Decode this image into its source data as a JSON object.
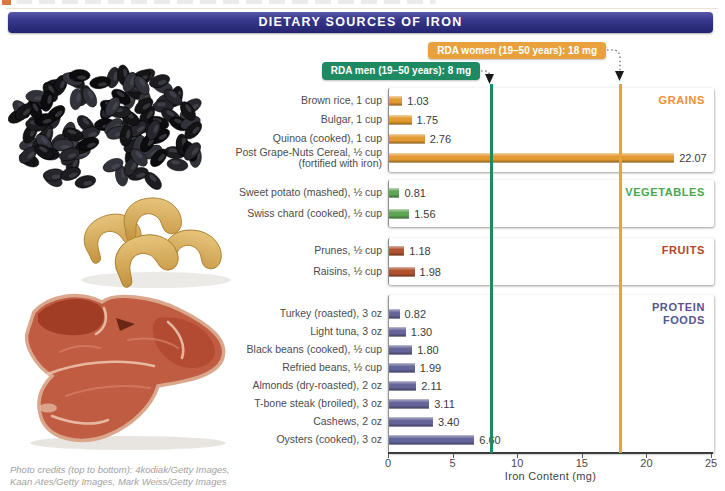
{
  "header": {
    "title": "DIETARY SOURCES OF IRON",
    "bar_color": "#32327e"
  },
  "rda": {
    "men": {
      "label": "RDA men (19–50 years): 8 mg",
      "value": 8,
      "color": "#1e8a62"
    },
    "women": {
      "label": "RDA women (19–50 years): 18 mg",
      "value": 18,
      "color": "#e8a13c"
    }
  },
  "chart_data": {
    "type": "bar",
    "orientation": "horizontal",
    "title": "Dietary Sources of Iron",
    "xlabel": "Iron Content (mg)",
    "xlim": [
      0,
      25
    ],
    "xticks": [
      0,
      5,
      10,
      15,
      20,
      25
    ],
    "grid": false,
    "reference_lines": [
      {
        "name": "RDA men (19–50 years)",
        "value": 8,
        "color": "#1e8a62"
      },
      {
        "name": "RDA women (19–50 years)",
        "value": 18,
        "color": "#e8a13c"
      }
    ],
    "groups": [
      {
        "name": "GRAINS",
        "bar_color": "#e39a31",
        "label_color": "#ef8f2d",
        "items": [
          {
            "label": "Brown rice, 1 cup",
            "value": 1.03,
            "display": "1.03"
          },
          {
            "label": "Bulgar, 1 cup",
            "value": 1.75,
            "display": "1.75"
          },
          {
            "label": "Quinoa (cooked), 1 cup",
            "value": 2.76,
            "display": "2.76"
          },
          {
            "label": "Post Grape-Nuts Cereal, ½ cup",
            "label2": "(fortified with iron)",
            "value": 22.07,
            "display": "22.07"
          }
        ]
      },
      {
        "name": "VEGETABLES",
        "bar_color": "#5ca653",
        "label_color": "#4ba64c",
        "items": [
          {
            "label": "Sweet potato (mashed), ½ cup",
            "value": 0.81,
            "display": "0.81"
          },
          {
            "label": "Swiss chard (cooked), ½ cup",
            "value": 1.56,
            "display": "1.56"
          }
        ]
      },
      {
        "name": "FRUITS",
        "bar_color": "#b05230",
        "label_color": "#b34426",
        "items": [
          {
            "label": "Prunes, ½ cup",
            "value": 1.18,
            "display": "1.18"
          },
          {
            "label": "Raisins, ½ cup",
            "value": 1.98,
            "display": "1.98"
          }
        ]
      },
      {
        "name": "PROTEIN FOODS",
        "name_lines": "PROTEIN\nFOODS",
        "bar_color": "#65659a",
        "label_color": "#55558f",
        "items": [
          {
            "label": "Turkey (roasted), 3 oz",
            "value": 0.82,
            "display": "0.82"
          },
          {
            "label": "Light tuna, 3 oz",
            "value": 1.3,
            "display": "1.30"
          },
          {
            "label": "Black beans (cooked), ½ cup",
            "value": 1.8,
            "display": "1.80"
          },
          {
            "label": "Refried beans, ½ cup",
            "value": 1.99,
            "display": "1.99"
          },
          {
            "label": "Almonds (dry-roasted), 2 oz",
            "value": 2.11,
            "display": "2.11"
          },
          {
            "label": "T-bone steak (broiled), 3 oz",
            "value": 3.11,
            "display": "3.11"
          },
          {
            "label": "Cashews, 2 oz",
            "value": 3.4,
            "display": "3.40"
          },
          {
            "label": "Oysters (cooked), 3 oz",
            "value": 6.6,
            "display": "6.60"
          }
        ]
      }
    ]
  },
  "photos": [
    {
      "name": "black-beans-photo",
      "description": "pile of black beans"
    },
    {
      "name": "cashews-photo",
      "description": "cashews"
    },
    {
      "name": "steak-photo",
      "description": "raw T-bone steak"
    }
  ],
  "footer": {
    "credits_line1": "Photo credits (top to bottom): 4kodiak/Getty Images,",
    "credits_line2": "Kaan Ates/Getty Images, Mark Weiss/Getty Images"
  }
}
